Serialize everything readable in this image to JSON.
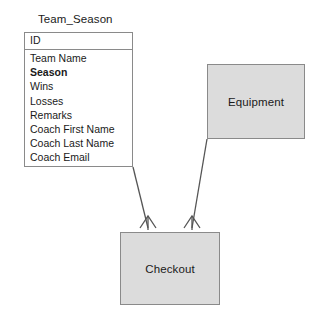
{
  "diagram": {
    "type": "entity-relationship-diagram",
    "notation": "crows-foot",
    "background_color": "#ffffff",
    "canvas": {
      "width": 331,
      "height": 313
    }
  },
  "entities": {
    "team_season": {
      "title": "Team_Season",
      "key_field": "ID",
      "attributes": [
        {
          "label": "Team Name",
          "bold": false
        },
        {
          "label": "Season",
          "bold": true
        },
        {
          "label": "Wins",
          "bold": false
        },
        {
          "label": "Losses",
          "bold": false
        },
        {
          "label": "Remarks",
          "bold": false
        },
        {
          "label": "Coach First Name",
          "bold": false
        },
        {
          "label": "Coach Last Name",
          "bold": false
        },
        {
          "label": "Coach Email",
          "bold": false
        }
      ],
      "fill_color": "#ffffff",
      "border_color": "#8a8a8a",
      "bounds": {
        "x": 24,
        "y": 32,
        "width": 109,
        "height": 135
      }
    },
    "equipment": {
      "title": "Equipment",
      "fill_color": "#dcdcdc",
      "border_color": "#8a8a8a",
      "bounds": {
        "x": 207,
        "y": 64,
        "width": 98,
        "height": 75
      }
    },
    "checkout": {
      "title": "Checkout",
      "fill_color": "#dcdcdc",
      "border_color": "#8a8a8a",
      "bounds": {
        "x": 120,
        "y": 232,
        "width": 100,
        "height": 73
      }
    }
  },
  "relationships": [
    {
      "name": "team-season-to-checkout",
      "from": "team_season",
      "to": "checkout",
      "to_cardinality": "many",
      "marker": "crows-foot",
      "line_color": "#555555"
    },
    {
      "name": "equipment-to-checkout",
      "from": "equipment",
      "to": "checkout",
      "to_cardinality": "many",
      "marker": "crows-foot",
      "line_color": "#555555"
    }
  ]
}
